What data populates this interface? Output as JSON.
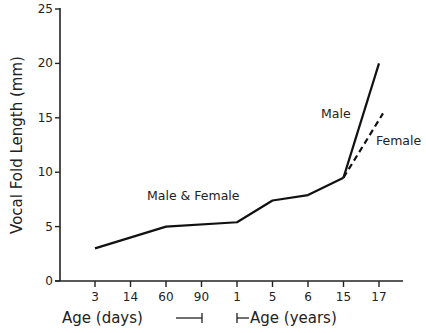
{
  "chart_data": {
    "type": "line",
    "title": "",
    "xlabel": "Age (days) / Age (years)",
    "ylabel": "Vocal Fold Length (mm)",
    "ylim": [
      0,
      25
    ],
    "yticks": [
      0,
      5,
      10,
      15,
      20,
      25
    ],
    "x_categories": [
      "3",
      "14",
      "60",
      "90",
      "1",
      "5",
      "6",
      "15",
      "17"
    ],
    "x_units": [
      "days",
      "days",
      "days",
      "days",
      "years",
      "years",
      "years",
      "years",
      "years"
    ],
    "x_axis_labels": {
      "days": "Age (days)",
      "years": "Age (years)"
    },
    "grid": false,
    "series": [
      {
        "name": "Male & Female",
        "style": "solid",
        "points": [
          {
            "x": "3 days",
            "y": 3.0
          },
          {
            "x": "60 days",
            "y": 5.0
          },
          {
            "x": "1 year",
            "y": 5.4
          },
          {
            "x": "5 years",
            "y": 7.4
          },
          {
            "x": "6 years",
            "y": 7.9
          },
          {
            "x": "15 years",
            "y": 9.5
          }
        ]
      },
      {
        "name": "Male",
        "style": "solid",
        "points": [
          {
            "x": "15 years",
            "y": 9.5
          },
          {
            "x": "17 years",
            "y": 20.0
          }
        ]
      },
      {
        "name": "Female",
        "style": "dashed",
        "points": [
          {
            "x": "15 years",
            "y": 9.5
          },
          {
            "x": "17 years",
            "y": 15.4
          }
        ]
      }
    ],
    "annotations": [
      "Male & Female",
      "Male",
      "Female"
    ]
  },
  "labels": {
    "ylabel": "Vocal Fold Length (mm)",
    "xlabel_days": "Age (days)",
    "xlabel_years": "Age (years)",
    "annot_both": "Male & Female",
    "annot_male": "Male",
    "annot_female": "Female"
  }
}
